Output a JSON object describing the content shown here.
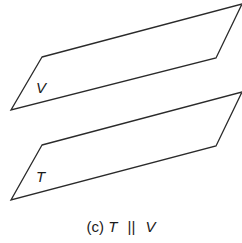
{
  "diagram": {
    "planes": [
      {
        "id": "V",
        "label": "V",
        "points": "42,57 242,4 216,58 11,110",
        "label_pos": [
          36,
          93
        ]
      },
      {
        "id": "T",
        "label": "T",
        "points": "42,145 242,92 216,146 11,200",
        "label_pos": [
          36,
          182
        ]
      }
    ],
    "stroke_color": "#2a2a2a"
  },
  "caption": {
    "prefix": "(c)",
    "left": "T",
    "symbol": "||",
    "right": "V"
  }
}
